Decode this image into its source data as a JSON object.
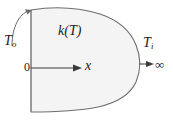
{
  "figure": {
    "type": "diagram",
    "background_color": "#ffffff",
    "body": {
      "fill_color": "#f4f4f4",
      "stroke_color": "#6e6e6e",
      "left_edge_label": "0"
    },
    "labels": {
      "conductivity": "k(T)",
      "surface_temperature_symbol": "T",
      "surface_temperature_subscript": "o",
      "interior_temperature_symbol": "T",
      "interior_temperature_subscript": "i",
      "origin": "0",
      "axis": "x",
      "infinity": "∞"
    },
    "arrows": {
      "x_axis_arrow": "arrow-right",
      "surface_temperature_arrow": "curved-arrow-up",
      "interior_temperature_arrow": "arrow-right"
    }
  }
}
